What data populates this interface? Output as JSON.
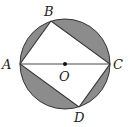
{
  "diagram": {
    "type": "geometry",
    "colors": {
      "stroke": "#333333",
      "shade": "#8c8c8c",
      "background": "#ffffff"
    },
    "points": {
      "A": {
        "label": "A",
        "x": 20,
        "y": 64
      },
      "B": {
        "label": "B",
        "x": 51,
        "y": 21
      },
      "C": {
        "label": "C",
        "x": 110,
        "y": 64
      },
      "D": {
        "label": "D",
        "x": 79,
        "y": 107
      },
      "O": {
        "label": "O",
        "x": 65,
        "y": 64
      }
    },
    "circle": {
      "cx": 65,
      "cy": 64,
      "r": 45
    }
  }
}
